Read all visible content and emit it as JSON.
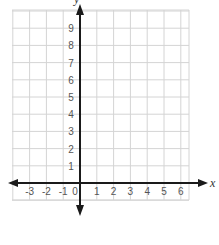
{
  "chart_data": {
    "type": "coordinate-grid",
    "title": "",
    "xlabel": "x",
    "ylabel": "y",
    "x_ticks": [
      "-3",
      "-2",
      "-1",
      "0",
      "1",
      "2",
      "3",
      "4",
      "5",
      "6"
    ],
    "y_ticks": [
      "1",
      "2",
      "3",
      "4",
      "5",
      "6",
      "7",
      "8",
      "9"
    ],
    "xlim": [
      -4,
      6.5
    ],
    "ylim": [
      -1,
      10
    ],
    "grid": true,
    "data_points": []
  },
  "colors": {
    "grid": "#d4d4d4",
    "axis": "#1a1a1a",
    "tick_text": "#555555"
  }
}
